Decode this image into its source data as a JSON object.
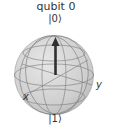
{
  "figure": {
    "title": "qubit 0",
    "labels": {
      "north": "|0⟩",
      "south": "|1⟩",
      "x_axis": "x",
      "y_axis": "y"
    },
    "sphere": {
      "fill": "#d4d4d4",
      "grid_color": "#7a7a7a"
    },
    "state_vector": {
      "direction": "up",
      "color": "#2f2f2f",
      "points_to": "|0⟩"
    }
  }
}
